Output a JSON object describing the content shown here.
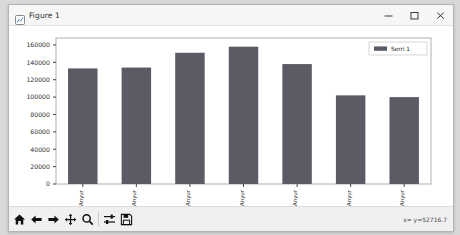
{
  "window": {
    "title": "Figure 1",
    "icon": "figure-icon",
    "controls": {
      "minimize": "minimize-icon",
      "maximize": "maximize-icon",
      "close": "close-icon"
    }
  },
  "toolbar": {
    "buttons": [
      {
        "name": "home-button",
        "icon": "home-icon",
        "tooltip": "Reset original view"
      },
      {
        "name": "back-button",
        "icon": "arrow-left-icon",
        "tooltip": "Back to previous view"
      },
      {
        "name": "forward-button",
        "icon": "arrow-right-icon",
        "tooltip": "Forward to next view"
      },
      {
        "name": "pan-button",
        "icon": "move-icon",
        "tooltip": "Pan axes with left mouse, zoom with right"
      },
      {
        "name": "zoom-button",
        "icon": "magnifier-icon",
        "tooltip": "Zoom to rectangle"
      },
      {
        "name": "subplots-button",
        "icon": "sliders-icon",
        "tooltip": "Configure subplots"
      },
      {
        "name": "save-button",
        "icon": "floppy-icon",
        "tooltip": "Save the figure"
      }
    ],
    "coordinates": "x=     y=52716.7"
  },
  "colors": {
    "bar": "#5b5b66",
    "axes_border": "#b0b0b0",
    "tick": "#303030",
    "canvas": "#ffffff"
  },
  "chart_data": {
    "type": "bar",
    "title": "",
    "xlabel": "",
    "ylabel": "",
    "categories": [
      "Anyur",
      "Anyur",
      "Anyur",
      "Anyur",
      "Anyur",
      "Anyur",
      "Anyur"
    ],
    "values": [
      133000,
      134000,
      151000,
      158000,
      138000,
      102000,
      100000
    ],
    "series": [
      {
        "name": "Serri 1",
        "values": [
          133000,
          134000,
          151000,
          158000,
          138000,
          102000,
          100000
        ]
      }
    ],
    "ylim": [
      0,
      168000
    ],
    "yticks": [
      0,
      20000,
      40000,
      60000,
      80000,
      100000,
      120000,
      140000,
      160000
    ],
    "ytick_labels": [
      "0",
      "20000",
      "40000",
      "60000",
      "80000",
      "100000",
      "120000",
      "140000",
      "160000"
    ],
    "grid": false,
    "legend": {
      "entries": [
        "Serri 1"
      ],
      "position": "upper right"
    },
    "xtick_rotation": 90
  }
}
